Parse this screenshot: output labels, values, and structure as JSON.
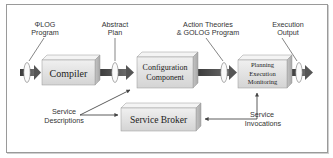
{
  "diagram": {
    "boxes": {
      "compiler": "Compiler",
      "configuration_line1": "Configuration",
      "configuration_line2": "Component",
      "pem_line1": "Planning",
      "pem_line2": "Execution",
      "pem_line3": "Monitoring",
      "broker": "Service Broker"
    },
    "labels": {
      "phi_log_line1": "ΦLOG",
      "phi_log_line2": "Program",
      "abstract_line1": "Abstract",
      "abstract_line2": "Plan",
      "action_line1": "Action Theories",
      "action_line2": "& GOLOG Program",
      "execution_line1": "Execution",
      "execution_line2": "Output",
      "service_desc_line1": "Service",
      "service_desc_line2": "Descriptions",
      "service_inv_line1": "Service",
      "service_inv_line2": "Invocations"
    },
    "colors": {
      "box_face": "#e4e4e4",
      "box_top": "#f2f2f2",
      "box_side": "#b8b8b8",
      "arrow": "#555555",
      "frame": "#9a9a9a"
    }
  }
}
